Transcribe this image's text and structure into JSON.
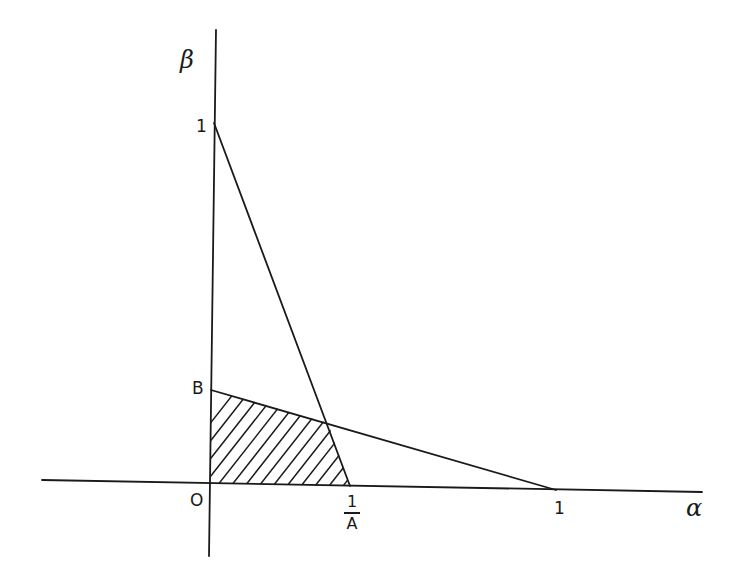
{
  "diagram": {
    "type": "linear-constraint-region",
    "axes": {
      "x_label": "α",
      "y_label": "β",
      "origin_label": "O"
    },
    "tick_labels": {
      "beta_one": "1",
      "beta_B": "B",
      "alpha_one": "1",
      "alpha_inv_A_numerator": "1",
      "alpha_inv_A_denominator": "A"
    },
    "lines": [
      {
        "name": "line-1-to-1-over-A",
        "from": "(0, 1)",
        "to": "(1/A, 0)"
      },
      {
        "name": "line-B-to-1",
        "from": "(0, B)",
        "to": "(1, 0)"
      }
    ],
    "shaded_region": {
      "description": "hatched region bounded by O, (1/A,0), intersection point, and (0,B)",
      "vertices": [
        "O",
        "1/A",
        "intersection",
        "B"
      ]
    },
    "colors": {
      "ink": "#1a1a1a",
      "background": "#ffffff"
    }
  }
}
